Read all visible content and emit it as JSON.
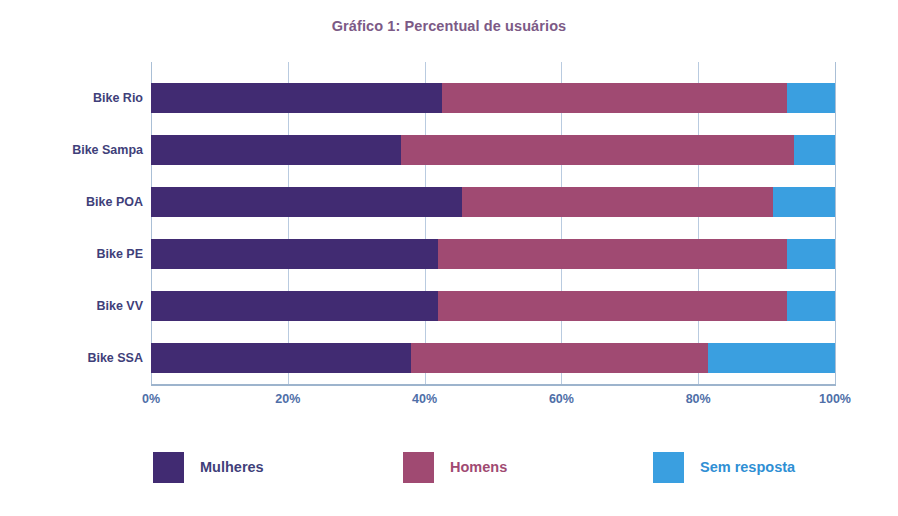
{
  "chart_data": {
    "type": "bar",
    "orientation": "horizontal",
    "stacked": true,
    "stack_mode": "percent",
    "title": "Gráfico 1: Percentual de usuários",
    "xlabel": "",
    "ylabel": "",
    "xlim": [
      0,
      100
    ],
    "xticks": [
      0,
      20,
      40,
      60,
      80,
      100
    ],
    "xtick_labels": [
      "0%",
      "20%",
      "40%",
      "60%",
      "80%",
      "100%"
    ],
    "grid": true,
    "grid_axis": "x",
    "legend_position": "bottom",
    "categories": [
      "Bike Rio",
      "Bike Sampa",
      "Bike POA",
      "Bike PE",
      "Bike VV",
      "Bike SSA"
    ],
    "series": [
      {
        "name": "Mulheres",
        "color": "#412b72",
        "values": [
          42.5,
          36.5,
          45.5,
          42.0,
          42.0,
          38.0
        ]
      },
      {
        "name": "Homens",
        "color": "#a04a72",
        "values": [
          50.5,
          57.5,
          45.5,
          51.0,
          51.0,
          43.5
        ]
      },
      {
        "name": "Sem resposta",
        "color": "#3a9fe0",
        "values": [
          7.0,
          6.0,
          9.0,
          7.0,
          7.0,
          18.5
        ]
      }
    ]
  },
  "colors": {
    "women": "#412b72",
    "men": "#a04a72",
    "no_answer": "#3a9fe0",
    "title_text": "#7c5a86",
    "category_text": "#3f3f7a",
    "tick_text": "#4f6fa8",
    "gridline": "#b9cbe0",
    "background": "#ffffff"
  },
  "legend": {
    "items": [
      {
        "label": "Mulheres",
        "color": "#412b72"
      },
      {
        "label": "Homens",
        "color": "#a04a72"
      },
      {
        "label": "Sem resposta",
        "color": "#3a9fe0"
      }
    ]
  }
}
